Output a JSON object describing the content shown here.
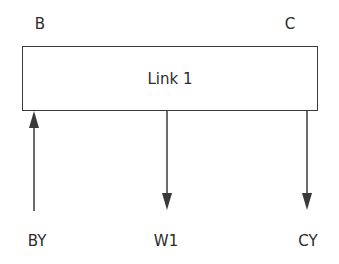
{
  "diagram": {
    "corner_labels": {
      "left": "B",
      "right": "C"
    },
    "link": {
      "label": "Link 1"
    },
    "arrows": [
      {
        "name": "BY",
        "direction": "up",
        "label": "BY"
      },
      {
        "name": "W1",
        "direction": "down",
        "label": "W1"
      },
      {
        "name": "CY",
        "direction": "down",
        "label": "CY"
      }
    ],
    "colors": {
      "stroke": "#3a3a3a",
      "text": "#2a2a2a",
      "background": "#ffffff"
    }
  }
}
